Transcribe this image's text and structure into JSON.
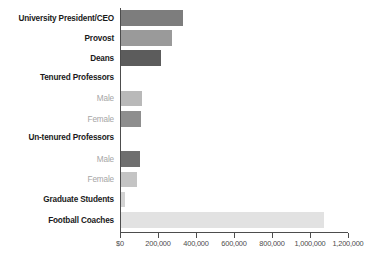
{
  "chart_data": {
    "type": "bar",
    "orientation": "horizontal",
    "title": "",
    "xlabel": "",
    "ylabel": "",
    "xlim": [
      0,
      1200000
    ],
    "grid": false,
    "legend": null,
    "xticks": [
      {
        "value": 0,
        "label": "$0"
      },
      {
        "value": 200000,
        "label": "200,000"
      },
      {
        "value": 400000,
        "label": "400,000"
      },
      {
        "value": 600000,
        "label": "600,000"
      },
      {
        "value": 800000,
        "label": "800,000"
      },
      {
        "value": 1000000,
        "label": "1,000,000"
      },
      {
        "value": 1200000,
        "label": "1,200,000"
      }
    ],
    "categories": [
      "University President/CEO",
      "Provost",
      "Deans",
      "Tenured Professors",
      "Male",
      "Female",
      "Un-tenured Professors",
      "Male",
      "Female",
      "Graduate Students",
      "Football Coaches"
    ],
    "values": [
      325000,
      270000,
      210000,
      null,
      110000,
      105000,
      null,
      100000,
      85000,
      20000,
      1070000
    ],
    "bars": [
      {
        "label": "University President/CEO",
        "value": 325000,
        "color": "#7d7d7d",
        "style": "major",
        "is_header": false
      },
      {
        "label": "Provost",
        "value": 270000,
        "color": "#9a9a9a",
        "style": "major",
        "is_header": false
      },
      {
        "label": "Deans",
        "value": 210000,
        "color": "#5c5c5c",
        "style": "major",
        "is_header": false
      },
      {
        "label": "Tenured Professors",
        "value": null,
        "color": null,
        "style": "major",
        "is_header": true
      },
      {
        "label": "Male",
        "value": 110000,
        "color": "#b9b9b9",
        "style": "minor",
        "is_header": false
      },
      {
        "label": "Female",
        "value": 105000,
        "color": "#8e8e8e",
        "style": "minor",
        "is_header": false
      },
      {
        "label": "Un-tenured Professors",
        "value": null,
        "color": null,
        "style": "major",
        "is_header": true
      },
      {
        "label": "Male",
        "value": 100000,
        "color": "#6f6f6f",
        "style": "minor",
        "is_header": false
      },
      {
        "label": "Female",
        "value": 85000,
        "color": "#c4c4c4",
        "style": "minor",
        "is_header": false
      },
      {
        "label": "Graduate Students",
        "value": 20000,
        "color": "#d3d3d3",
        "style": "major",
        "is_header": false
      },
      {
        "label": "Football Coaches",
        "value": 1070000,
        "color": "#e2e2e2",
        "style": "major",
        "is_header": false
      }
    ],
    "colors": {
      "axis": "#4d4d4d",
      "label_major": "#1a1a1a",
      "label_minor": "#a6a6a6",
      "background": "#ffffff"
    }
  }
}
